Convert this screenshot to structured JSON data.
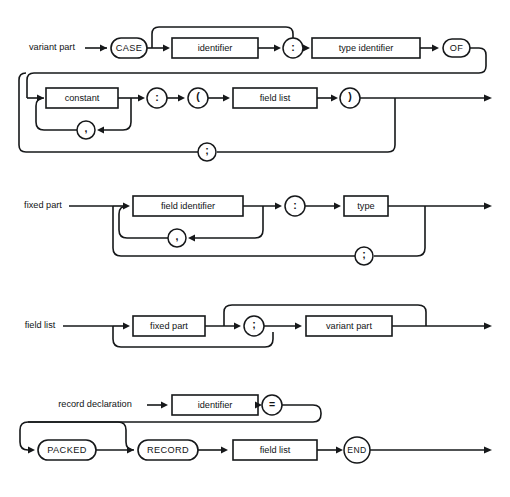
{
  "page": {
    "background_color": "#ffffff",
    "line_color": "#16181a",
    "width": 510,
    "height": 497
  },
  "diagrams": [
    {
      "id": "variant-part",
      "entry_label": "variant part",
      "nodes": {
        "case_keyword": "CASE",
        "identifier": "identifier",
        "colon": ":",
        "type_identifier": "type identifier",
        "of_keyword": "OF",
        "constant": "constant",
        "colon2": ":",
        "lparen": "(",
        "field_list": "field list",
        "rparen": ")",
        "comma": ",",
        "semicolon": ";"
      }
    },
    {
      "id": "fixed-part",
      "entry_label": "fixed part",
      "nodes": {
        "field_identifier": "field identifier",
        "comma": ",",
        "colon": ":",
        "type": "type",
        "semicolon": ";"
      }
    },
    {
      "id": "field-list",
      "entry_label": "field list",
      "nodes": {
        "fixed_part": "fixed part",
        "semicolon": ";",
        "variant_part": "variant part"
      }
    },
    {
      "id": "record-declaration",
      "entry_label": "record declaration",
      "nodes": {
        "identifier": "identifier",
        "equals": "=",
        "packed_keyword": "PACKED",
        "record_keyword": "RECORD",
        "field_list": "field list",
        "end_keyword": "END"
      }
    }
  ]
}
